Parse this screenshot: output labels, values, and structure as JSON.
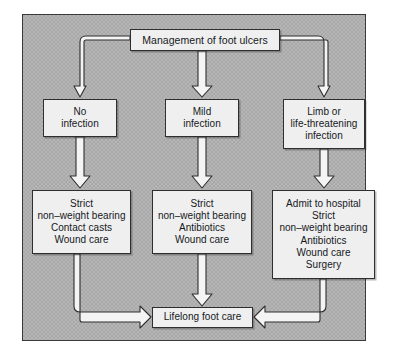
{
  "diagram": {
    "title_node": {
      "label": "Management of foot ulcers"
    },
    "severity_nodes": [
      {
        "name": "no-infection",
        "lines": [
          "No",
          "infection"
        ]
      },
      {
        "name": "mild-infection",
        "lines": [
          "Mild",
          "infection"
        ]
      },
      {
        "name": "limb-infection",
        "lines": [
          "Limb or",
          "life-threatening",
          "infection"
        ]
      }
    ],
    "treatment_nodes": [
      {
        "name": "tx-no-infection",
        "lines": [
          "Strict",
          "non–weight bearing",
          "Contact casts",
          "Wound care"
        ]
      },
      {
        "name": "tx-mild-infection",
        "lines": [
          "Strict",
          "non–weight bearing",
          "Antibiotics",
          "Wound care"
        ]
      },
      {
        "name": "tx-limb-infection",
        "lines": [
          "Admit to hospital",
          "Strict",
          "non–weight bearing",
          "Antibiotics",
          "Wound care",
          "Surgery"
        ]
      }
    ],
    "outcome_node": {
      "label": "Lifelong foot care"
    },
    "colors": {
      "panel_background": "#a8a8a8",
      "node_fill": "#efefef",
      "node_border": "#2e2e2e",
      "arrow_fill": "#f4f4f4",
      "arrow_border": "#2e2e2e",
      "text": "#15191c"
    }
  }
}
